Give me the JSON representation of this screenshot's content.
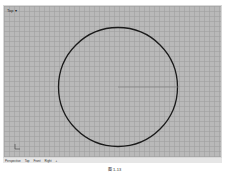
{
  "viewport": {
    "label": "Top ▾",
    "background": "#b9b9b9",
    "circle": {
      "cx": 118,
      "cy": 87,
      "r": 59.5,
      "stroke": "#1a1a1a"
    },
    "radius_line": {
      "x1": 118,
      "y1": 87,
      "x2": 178,
      "y2": 87,
      "stroke": "#7a7a7a"
    }
  },
  "tabs": [
    {
      "label": "Perspective"
    },
    {
      "label": "Top"
    },
    {
      "label": "Front"
    },
    {
      "label": "Right"
    },
    {
      "label": "+"
    }
  ],
  "caption": "图 1-13"
}
